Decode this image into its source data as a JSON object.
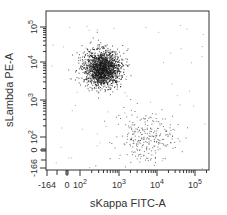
{
  "chart_data": {
    "type": "scatter",
    "title": "",
    "xlabel": "sKappa FITC-A",
    "ylabel": "sLambda PE-A",
    "x_scale": "biexponential",
    "y_scale": "biexponential",
    "xlim": [
      -164,
      200000
    ],
    "ylim": [
      -166,
      200000
    ],
    "grid": false,
    "legend": null,
    "x_ticks": [
      {
        "label": "-164",
        "base": "",
        "exp": "",
        "px": 47
      },
      {
        "label": "0",
        "base": "",
        "exp": "",
        "px": 67
      },
      {
        "label": "10",
        "base": "10",
        "exp": "2",
        "px": 80
      },
      {
        "label": "10",
        "base": "10",
        "exp": "3",
        "px": 119
      },
      {
        "label": "10",
        "base": "10",
        "exp": "4",
        "px": 157
      },
      {
        "label": "10",
        "base": "10",
        "exp": "5",
        "px": 195
      }
    ],
    "y_ticks": [
      {
        "label": "10",
        "base": "10",
        "exp": "5",
        "px": 27
      },
      {
        "label": "10",
        "base": "10",
        "exp": "4",
        "px": 62
      },
      {
        "label": "10",
        "base": "10",
        "exp": "3",
        "px": 100
      },
      {
        "label": "10",
        "base": "10",
        "exp": "2",
        "px": 137
      },
      {
        "label": "0",
        "base": "",
        "exp": "",
        "px": 150
      },
      {
        "label": "-166",
        "base": "",
        "exp": "",
        "px": 168
      }
    ],
    "populations": [
      {
        "name": "Lambda+ (sKappa low / sLambda high)",
        "center_x_approx": 300,
        "center_y_approx": 8000,
        "events_approx": 1800,
        "px_center": [
          102,
          68
        ],
        "px_sigma": [
          9,
          9
        ],
        "color": "#1a1a1a"
      },
      {
        "name": "Kappa+ (sKappa high / sLambda low)",
        "center_x_approx": 5000,
        "center_y_approx": 60,
        "events_approx": 260,
        "px_center": [
          146,
          138
        ],
        "px_sigma": [
          15,
          13
        ],
        "color": "#444444"
      },
      {
        "name": "scattered background",
        "events_approx": 60,
        "px_range_x": [
          50,
          205
        ],
        "px_range_y": [
          25,
          168
        ],
        "color": "#777777"
      }
    ]
  },
  "plot_frame": {
    "left": 46,
    "top": 11,
    "right": 209,
    "bottom": 170
  },
  "colors": {
    "axis": "#333333",
    "dots": "#1a1a1a",
    "background": "#ffffff"
  }
}
